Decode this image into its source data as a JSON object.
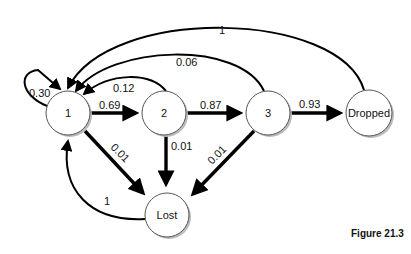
{
  "diagram": {
    "type": "state-transition-graph",
    "nodes": [
      {
        "id": "1",
        "label": "1"
      },
      {
        "id": "2",
        "label": "2"
      },
      {
        "id": "3",
        "label": "3"
      },
      {
        "id": "dropped",
        "label": "Dropped"
      },
      {
        "id": "lost",
        "label": "Lost"
      }
    ],
    "edges": [
      {
        "from": "1",
        "to": "1",
        "label": "0.30"
      },
      {
        "from": "1",
        "to": "2",
        "label": "0.69"
      },
      {
        "from": "2",
        "to": "3",
        "label": "0.87"
      },
      {
        "from": "3",
        "to": "dropped",
        "label": "0.93"
      },
      {
        "from": "2",
        "to": "1",
        "label": "0.12"
      },
      {
        "from": "3",
        "to": "1",
        "label": "0.06"
      },
      {
        "from": "dropped",
        "to": "1",
        "label": "1"
      },
      {
        "from": "1",
        "to": "lost",
        "label": "0.01"
      },
      {
        "from": "2",
        "to": "lost",
        "label": "0.01"
      },
      {
        "from": "3",
        "to": "lost",
        "label": "0.01"
      },
      {
        "from": "lost",
        "to": "1",
        "label": "1"
      }
    ]
  },
  "caption": "Figure 21.3"
}
